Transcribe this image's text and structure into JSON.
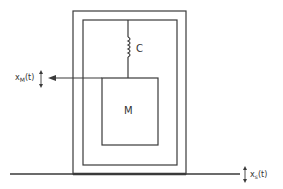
{
  "diagram": {
    "labels": {
      "spring": "C",
      "mass": "M",
      "mass_displacement": "x",
      "mass_displacement_sub": "M",
      "mass_displacement_arg": "(t)",
      "support_displacement": "x",
      "support_displacement_sub": "s",
      "support_displacement_arg": "(t)"
    },
    "colors": {
      "line": "#3a3a3a",
      "background": "#ffffff"
    }
  }
}
